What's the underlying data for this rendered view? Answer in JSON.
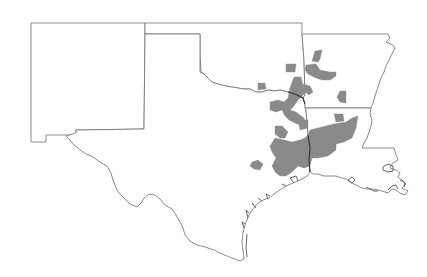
{
  "map": {
    "type": "choropleth",
    "title": "",
    "colors": {
      "background": "#ffffff",
      "state_border": "#6e6e6e",
      "highlighted_region": "#8a8a8a",
      "river_border": "#333333"
    },
    "states": [
      {
        "name": "New Mexico",
        "abbr": "NM"
      },
      {
        "name": "Oklahoma",
        "abbr": "OK"
      },
      {
        "name": "Texas",
        "abbr": "TX"
      },
      {
        "name": "Arkansas",
        "abbr": "AR"
      },
      {
        "name": "Louisiana",
        "abbr": "LA"
      }
    ],
    "highlighted_region_groups": [
      {
        "location": "eastern Oklahoma / western Arkansas",
        "count": 6
      },
      {
        "location": "northeast Texas / southeast Oklahoma",
        "count": 4
      },
      {
        "location": "east Texas / west Louisiana",
        "count": 5
      },
      {
        "location": "central Texas outlier",
        "count": 1
      }
    ]
  }
}
